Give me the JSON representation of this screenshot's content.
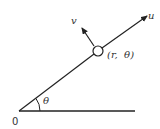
{
  "diagram": {
    "type": "polar-coordinates-unit-vectors",
    "origin_label": "0",
    "angle_label": "θ",
    "point_label": "(r,  θ)",
    "radial_vector_label": "u",
    "transverse_vector_label": "v",
    "colors": {
      "stroke": "#222222",
      "background": "#ffffff"
    }
  }
}
